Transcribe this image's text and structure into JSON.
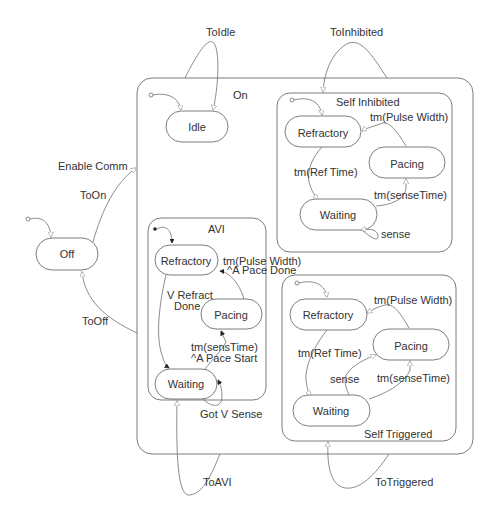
{
  "diagram": {
    "type": "statechart",
    "colors": {
      "stroke": "#6e6e6e",
      "text": "#333333",
      "background": "#ffffff"
    },
    "top_level": {
      "off": {
        "label": "Off"
      },
      "on": {
        "label": "On"
      }
    },
    "transitions_top": {
      "to_on": "ToOn",
      "enable_comm": "Enable Comm",
      "to_off": "ToOff",
      "to_idle": "ToIdle",
      "to_inhibited": "ToInhibited",
      "to_avi": "ToAVI",
      "to_triggered": "ToTriggered"
    },
    "idle": {
      "label": "Idle"
    },
    "avi": {
      "label": "AVI",
      "refractory": "Refractory",
      "pacing": "Pacing",
      "waiting": "Waiting",
      "t_refract_done_1": "V Refract",
      "t_refract_done_2": "Done",
      "t_pulse_1": "tm(Pulse Width)",
      "t_pulse_2": "^A Pace Done",
      "t_sens_1": "tm(sensTime)",
      "t_sens_2": "^A Pace Start",
      "t_got_sense": "Got V Sense"
    },
    "self_inhibited": {
      "label": "Self Inhibited",
      "refractory": "Refractory",
      "pacing": "Pacing",
      "waiting": "Waiting",
      "t_pulse": "tm(Pulse Width)",
      "t_ref": "tm(Ref Time)",
      "t_sense_time": "tm(senseTime)",
      "t_sense": "sense"
    },
    "self_triggered": {
      "label": "Self Triggered",
      "refractory": "Refractory",
      "pacing": "Pacing",
      "waiting": "Waiting",
      "t_pulse": "tm(Pulse Width)",
      "t_ref": "tm(Ref Time)",
      "t_sense_time": "tm(senseTime)",
      "t_sense": "sense"
    }
  }
}
